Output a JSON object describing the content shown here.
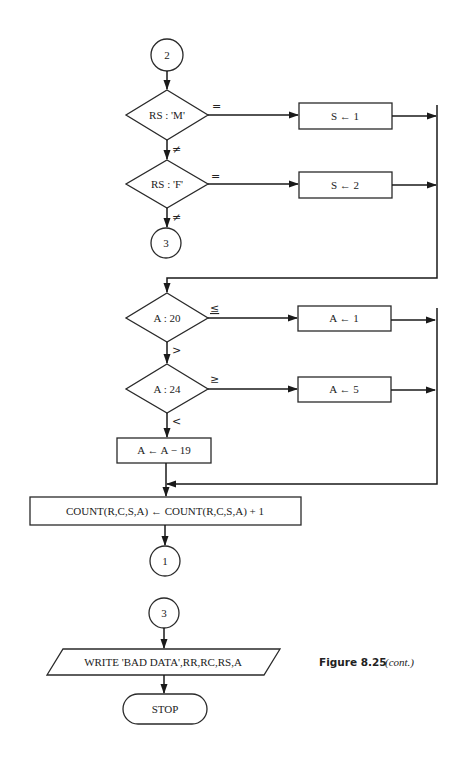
{
  "figure": {
    "caption": "Figure 8.25",
    "caption_note": "(cont.)"
  },
  "connectors": {
    "entry": "2",
    "exit_bad": "3",
    "return": "1",
    "bad_entry": "3"
  },
  "decisions": [
    {
      "label": "RS : 'M'",
      "true_label": "=",
      "false_label": "≠"
    },
    {
      "label": "RS : 'F'",
      "true_label": "=",
      "false_label": "≠"
    },
    {
      "label": "A : 20",
      "true_label": "≤",
      "false_label": ">"
    },
    {
      "label": "A : 24",
      "true_label": "≥",
      "false_label": "<"
    }
  ],
  "processes": {
    "s1": "S ← 1",
    "s2": "S ← 2",
    "a1": "A ← 1",
    "a5": "A ← 5",
    "a_minus": "A ← A − 19",
    "count": "COUNT(R,C,S,A) ← COUNT(R,C,S,A) + 1"
  },
  "io": {
    "write": "WRITE 'BAD DATA',RR,RC,RS,A"
  },
  "terminal": {
    "stop": "STOP"
  }
}
